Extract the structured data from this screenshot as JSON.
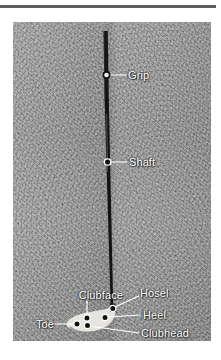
{
  "figure": {
    "kind": "photograph-diagram",
    "background_color": "#9a9a9a",
    "club_color": "#151515",
    "label_color": "#ffffff",
    "leader_color": "#ffffff",
    "marker_fill": "#111111",
    "marker_stroke": "#ffffff"
  },
  "rule": {
    "color": "#5d5d5d"
  },
  "callouts": [
    {
      "id": "grip",
      "label": "Grip",
      "side": "right",
      "marker": "hollow"
    },
    {
      "id": "shaft",
      "label": "Shaft",
      "side": "right",
      "marker": "filled"
    },
    {
      "id": "hosel",
      "label": "Hosel",
      "side": "right",
      "marker": "filled"
    },
    {
      "id": "heel",
      "label": "Heel",
      "side": "right",
      "marker": "filled"
    },
    {
      "id": "clubhead",
      "label": "Clubhead",
      "side": "right",
      "marker": "filled"
    },
    {
      "id": "clubface",
      "label": "Clubface",
      "side": "left",
      "marker": "none"
    },
    {
      "id": "toe",
      "label": "Toe",
      "side": "left",
      "marker": "filled"
    }
  ]
}
